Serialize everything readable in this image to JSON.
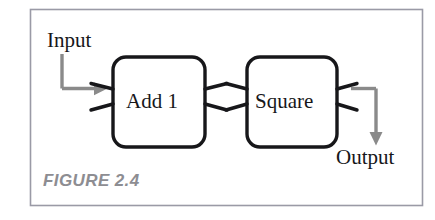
{
  "figure": {
    "caption": "FIGURE 2.4",
    "caption_color": "#8d8d92",
    "border_color": "#9a9aa6",
    "background": "#ffffff"
  },
  "diagram": {
    "type": "block-flow",
    "stroke_color": "#17171a",
    "arrow_color": "#8a8a8a",
    "blocks": [
      {
        "id": "block-add1",
        "label": "Add 1"
      },
      {
        "id": "block-square",
        "label": "Square"
      }
    ],
    "ports": [
      {
        "id": "input-label",
        "label": "Input"
      },
      {
        "id": "output-label",
        "label": "Output"
      }
    ],
    "flow": "Input → Add 1 → Square → Output",
    "icons": {
      "input_arrow": "arrow-right-icon",
      "output_arrow": "arrow-down-icon"
    }
  }
}
